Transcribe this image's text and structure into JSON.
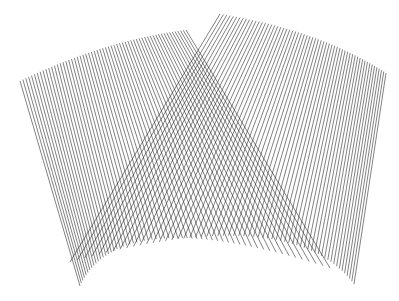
{
  "figure": {
    "width": 399,
    "height": 301,
    "background": "#ffffff",
    "stroke": "#1a1a1a",
    "stroke_width": 0.55,
    "families": [
      {
        "name": "left-fan",
        "count": 60,
        "top": {
          "from": [
            20,
            81
          ],
          "ctrl": [
            105,
            40
          ],
          "to": [
            186,
            30
          ]
        },
        "bottom": {
          "from": [
            80,
            286
          ],
          "ctrl": [
            120,
            200
          ],
          "to": [
            330,
            268
          ]
        }
      },
      {
        "name": "right-fan",
        "count": 60,
        "top": {
          "from": [
            220,
            14
          ],
          "ctrl": [
            320,
            30
          ],
          "to": [
            386,
            73
          ]
        },
        "bottom": {
          "from": [
            70,
            262
          ],
          "ctrl": [
            290,
            200
          ],
          "to": [
            354,
            284
          ]
        }
      }
    ]
  }
}
